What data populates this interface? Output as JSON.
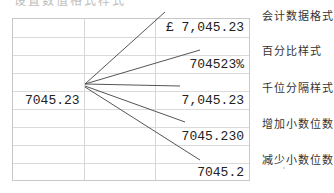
{
  "header_cut_text": "设置数值格式样式",
  "spreadsheet": {
    "source_cell": "7045.23",
    "formatted_cells": [
      {
        "format": "accounting",
        "value": "£ 7,045.23"
      },
      {
        "format": "percent",
        "value": "704523%"
      },
      {
        "format": "thousands-separator",
        "value": "7,045.23"
      },
      {
        "format": "increase-decimal",
        "value": "7045.230"
      },
      {
        "format": "decrease-decimal",
        "value": "7045.2"
      }
    ]
  },
  "labels": [
    "会计数据格式",
    "百分比样式",
    "千位分隔样式",
    "增加小数位数",
    "减少小数位数"
  ],
  "colors": {
    "gridline": "#d6d6d6",
    "connector_line": "#555555",
    "text": "#222222"
  }
}
